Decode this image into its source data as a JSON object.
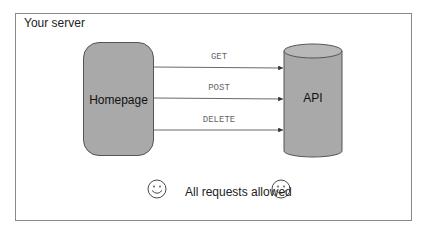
{
  "diagram": {
    "container_label": "Your server",
    "source_node": "Homepage",
    "target_node": "API",
    "requests": [
      {
        "method": "GET"
      },
      {
        "method": "POST"
      },
      {
        "method": "DELETE"
      }
    ],
    "footer_text": "All requests allowed",
    "footer_icon": "smiley-face-icon"
  },
  "colors": {
    "node_fill": "#a9a9a9",
    "border": "#555555",
    "label_text": "#666666"
  }
}
